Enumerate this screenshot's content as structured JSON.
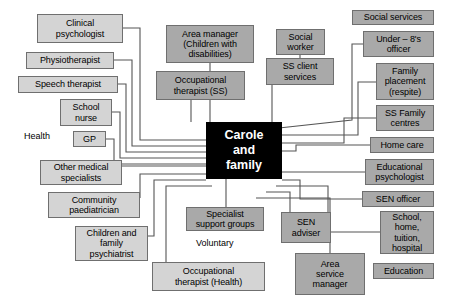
{
  "diagram": {
    "hub": {
      "label": "Carole\nand\nfamily",
      "color": "#000000",
      "text_color": "#ffffff"
    },
    "colors": {
      "light_box": "#d4d4d4",
      "dark_box": "#a9a9a9",
      "border": "#6f6f6f",
      "connector": "#555555",
      "background": "#ffffff"
    },
    "nodes": [
      {
        "id": "clinical-psychologist",
        "label": "Clinical\npsychologist",
        "shade": "light",
        "x": 37,
        "y": 14,
        "w": 86,
        "h": 29
      },
      {
        "id": "physiotherapist",
        "label": "Physiotherapist",
        "shade": "light",
        "x": 26,
        "y": 52,
        "w": 88,
        "h": 17
      },
      {
        "id": "speech-therapist",
        "label": "Speech therapist",
        "shade": "light",
        "x": 18,
        "y": 76,
        "w": 100,
        "h": 17
      },
      {
        "id": "school-nurse",
        "label": "School\nnurse",
        "shade": "light",
        "x": 60,
        "y": 99,
        "w": 52,
        "h": 27
      },
      {
        "id": "gp",
        "label": "GP",
        "shade": "light",
        "x": 73,
        "y": 131,
        "w": 33,
        "h": 16
      },
      {
        "id": "other-medical-specialists",
        "label": "Other medical\nspecialists",
        "shade": "light",
        "x": 40,
        "y": 160,
        "w": 82,
        "h": 25
      },
      {
        "id": "community-paediatrician",
        "label": "Community\npaediatrician",
        "shade": "light",
        "x": 48,
        "y": 192,
        "w": 92,
        "h": 26
      },
      {
        "id": "children-and-family-psychiatrist",
        "label": "Children and\nfamily\npsychiatrist",
        "shade": "light",
        "x": 75,
        "y": 226,
        "w": 73,
        "h": 35
      },
      {
        "id": "occupational-therapist-health",
        "label": "Occupational\ntherapist (Health)",
        "shade": "light",
        "x": 152,
        "y": 262,
        "w": 113,
        "h": 29
      },
      {
        "id": "specialist-support-groups",
        "label": "Specialist\nsupport groups",
        "shade": "dark",
        "x": 186,
        "y": 207,
        "w": 78,
        "h": 24
      },
      {
        "id": "area-manager-children-with-disabilities",
        "label": "Area manager\n(Children with\ndisabilities)",
        "shade": "dark",
        "x": 166,
        "y": 25,
        "w": 88,
        "h": 38
      },
      {
        "id": "occupational-therapist-ss",
        "label": "Occupational\ntherapist (SS)",
        "shade": "dark",
        "x": 156,
        "y": 71,
        "w": 89,
        "h": 29
      },
      {
        "id": "social-worker",
        "label": "Social\nworker",
        "shade": "dark",
        "x": 276,
        "y": 29,
        "w": 49,
        "h": 26
      },
      {
        "id": "ss-client-services",
        "label": "SS client\nservices",
        "shade": "dark",
        "x": 266,
        "y": 58,
        "w": 68,
        "h": 27
      },
      {
        "id": "social-services",
        "label": "Social services",
        "shade": "dark",
        "x": 352,
        "y": 10,
        "w": 82,
        "h": 15
      },
      {
        "id": "under-8s-officer",
        "label": "Under – 8's\nofficer",
        "shade": "dark",
        "x": 363,
        "y": 31,
        "w": 71,
        "h": 26
      },
      {
        "id": "family-placement-respite",
        "label": "Family\nplacement\n(respite)",
        "shade": "dark",
        "x": 376,
        "y": 63,
        "w": 58,
        "h": 37
      },
      {
        "id": "ss-family-centres",
        "label": "SS Family\ncentres",
        "shade": "dark",
        "x": 376,
        "y": 105,
        "w": 58,
        "h": 26
      },
      {
        "id": "home-care",
        "label": "Home care",
        "shade": "dark",
        "x": 370,
        "y": 137,
        "w": 64,
        "h": 16
      },
      {
        "id": "educational-psychologist",
        "label": "Educational\npsychologist",
        "shade": "dark",
        "x": 365,
        "y": 159,
        "w": 69,
        "h": 26
      },
      {
        "id": "sen-officer",
        "label": "SEN officer",
        "shade": "dark",
        "x": 362,
        "y": 191,
        "w": 72,
        "h": 16
      },
      {
        "id": "school-home-tuition-hospital",
        "label": "School,\nhome,\ntuition,\nhospital",
        "shade": "dark",
        "x": 380,
        "y": 211,
        "w": 54,
        "h": 43
      },
      {
        "id": "education",
        "label": "Education",
        "shade": "dark",
        "x": 373,
        "y": 263,
        "w": 61,
        "h": 16
      },
      {
        "id": "sen-adviser",
        "label": "SEN\nadviser",
        "shade": "dark",
        "x": 281,
        "y": 212,
        "w": 50,
        "h": 31
      },
      {
        "id": "area-service-manager",
        "label": "Area\nservice\nmanager",
        "shade": "dark",
        "x": 295,
        "y": 253,
        "w": 70,
        "h": 42
      }
    ],
    "plain_labels": [
      {
        "id": "health-label",
        "label": "Health",
        "x": 24,
        "y": 131
      },
      {
        "id": "voluntary-label",
        "label": "Voluntary",
        "x": 196,
        "y": 238
      }
    ],
    "hub_box": {
      "x": 206,
      "y": 122,
      "w": 76,
      "h": 57
    },
    "connectors": [
      {
        "from": "clinical-psychologist",
        "to": "hub",
        "path": "M123,28 H140 V140 H206"
      },
      {
        "from": "physiotherapist",
        "to": "hub",
        "path": "M114,60 H132 V146 H206"
      },
      {
        "from": "speech-therapist",
        "to": "hub",
        "path": "M118,84 H126 V152 H206"
      },
      {
        "from": "school-nurse",
        "to": "hub",
        "path": "M112,112 H120 V158 H206"
      },
      {
        "from": "gp",
        "to": "hub",
        "path": "M106,139 H114 V164 H206"
      },
      {
        "from": "other-medical-specialists",
        "to": "hub",
        "path": "M122,166 H206"
      },
      {
        "from": "community-paediatrician",
        "to": "hub",
        "path": "M140,198 V174 H206"
      },
      {
        "from": "children-and-family-psychiatrist",
        "to": "hub",
        "path": "M148,236 H154 V180 H206"
      },
      {
        "from": "occupational-therapist-health",
        "to": "hub",
        "path": "M166,262 V186 H212"
      },
      {
        "from": "specialist-support-groups",
        "to": "hub",
        "path": "M226,207 V179"
      },
      {
        "from": "area-manager-children-with-disabilities",
        "to": "hub",
        "path": "M210,63 V122"
      },
      {
        "from": "occupational-therapist-ss",
        "to": "hub",
        "path": "M191,100 V122"
      },
      {
        "from": "social-worker",
        "to": "ss-client-services",
        "path": "M300,55 V58"
      },
      {
        "from": "ss-client-services",
        "to": "hub",
        "path": "M272,85 V122"
      },
      {
        "from": "under-8s-officer",
        "to": "hub",
        "path": "M363,44 H352 V120 L279,128"
      },
      {
        "from": "family-placement-respite",
        "to": "hub",
        "path": "M376,82 H358 V135 H282"
      },
      {
        "from": "ss-family-centres",
        "to": "hub",
        "path": "M376,118 H344 V143 H282"
      },
      {
        "from": "home-care",
        "to": "hub",
        "path": "M370,145 H296 V151 H282"
      },
      {
        "from": "educational-psychologist",
        "to": "hub",
        "path": "M365,172 H282"
      },
      {
        "from": "sen-officer",
        "to": "hub",
        "path": "M362,199 H300 V180 H282"
      },
      {
        "from": "school-home-tuition-hospital",
        "to": "hub",
        "path": "M380,232 H328 V186 H276"
      },
      {
        "from": "sen-adviser",
        "to": "hub",
        "path": "M290,212 V192 H266"
      },
      {
        "from": "area-service-manager",
        "to": "hub",
        "path": "M330,253 V198 H256"
      }
    ]
  }
}
